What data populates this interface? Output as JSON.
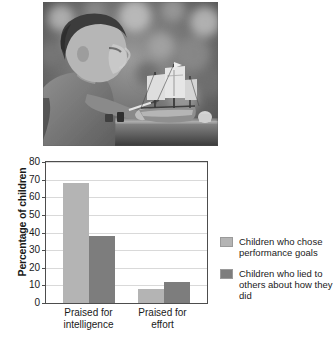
{
  "photo": {
    "alt_description": "Black and white photograph of a boy working on a model sailing ship at a table",
    "subject": "boy building model ship",
    "palette": {
      "background": "#6e6e6e",
      "highlight": "#d8d8d8",
      "shadow": "#2a2a2a"
    }
  },
  "chart_data": {
    "type": "bar",
    "title": "",
    "subtitle": "",
    "xlabel": "",
    "ylabel": "Percentage of children",
    "ylim": [
      0,
      80
    ],
    "yticks": [
      0,
      10,
      20,
      30,
      40,
      50,
      60,
      70,
      80
    ],
    "ytick_labels": [
      "0",
      "10",
      "20",
      "30",
      "40",
      "50",
      "60",
      "70",
      "80"
    ],
    "grid": true,
    "grid_axis": "y",
    "categories": [
      "Praised for intelligence",
      "Praised for effort"
    ],
    "category_labels": [
      "Praised for\nintelligence",
      "Praised for\neffort"
    ],
    "series": [
      {
        "name": "Children who chose performance goals",
        "values": [
          68,
          8
        ],
        "color": "#b4b4b4"
      },
      {
        "name": "Children who lied to others about how they did",
        "values": [
          38,
          12
        ],
        "color": "#7d7d7d"
      }
    ],
    "legend_position": "right",
    "annotations": []
  },
  "legend": {
    "entries": [
      {
        "label": "Children who chose performance goals",
        "color": "#b4b4b4"
      },
      {
        "label": "Children who lied to others about how they did",
        "color": "#7d7d7d"
      }
    ]
  },
  "colors": {
    "series_light": "#b4b4b4",
    "series_dark": "#7d7d7d",
    "axis": "#4d4d4d",
    "gridline": "#d9d9d9",
    "text": "#1a1a1a",
    "background": "#ffffff"
  }
}
